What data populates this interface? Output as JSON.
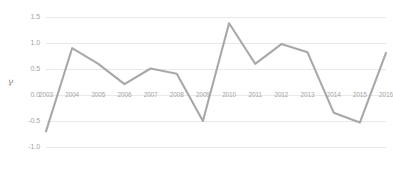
{
  "chart_data": {
    "type": "line",
    "title": "",
    "subtitle": "",
    "xlabel": "",
    "ylabel": "℃",
    "categories": [
      "2003",
      "2004",
      "2005",
      "2006",
      "2007",
      "2008",
      "2009",
      "2010",
      "2011",
      "2012",
      "2013",
      "2014",
      "2015",
      "2016"
    ],
    "values": [
      -0.7,
      0.9,
      0.6,
      0.21,
      0.51,
      0.41,
      -0.5,
      1.38,
      0.6,
      0.98,
      0.82,
      -0.34,
      -0.53,
      0.81
    ],
    "series": [
      {
        "name": "Temperature anomaly",
        "values": [
          -0.7,
          0.9,
          0.6,
          0.21,
          0.51,
          0.41,
          -0.5,
          1.38,
          0.6,
          0.98,
          0.82,
          -0.34,
          -0.53,
          0.81
        ]
      }
    ],
    "ylim": [
      -1.0,
      1.5
    ],
    "yticks": [
      1.5,
      1.0,
      0.5,
      0.0,
      -0.5,
      -1.0
    ],
    "ytick_labels": [
      "1.5",
      "1.0",
      "0.5",
      "0.0",
      "-0.5",
      "-1.0"
    ],
    "xtick_labels": [
      "2003",
      "2004",
      "2005",
      "2006",
      "2007",
      "2008",
      "2009",
      "2010",
      "2011",
      "2012",
      "2013",
      "2014",
      "2015",
      "2016"
    ],
    "grid": true,
    "grid_axis": "y",
    "legend": false,
    "legend_position": "none",
    "line_color": "#a8a8a8",
    "grid_color": "#e9e9e9",
    "text_color": "#a4a4a4",
    "background_color": "#ffffff",
    "markers": false,
    "annotations": []
  }
}
